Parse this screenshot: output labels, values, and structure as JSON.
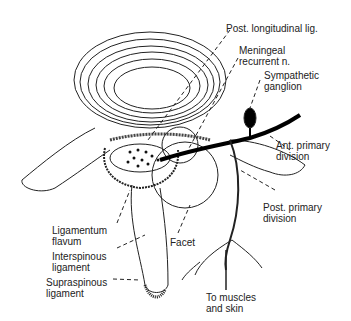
{
  "figure": {
    "labels": {
      "post_longitudinal_lig": "Post. longitudinal lig.",
      "meningeal_recurrent_n": "Meningeal\nrecurrent n.",
      "sympathetic_ganglion": "Sympathetic\nganglion",
      "ant_primary_division": "Ant. primary\ndivision",
      "post_primary_division": "Post. primary\ndivision",
      "ligamentum_flavum": "Ligamentum\nflavum",
      "interspinous_ligament": "Interspinous\nligament",
      "supraspinous_ligament": "Supraspinous\nligament",
      "facet": "Facet",
      "to_muscles_and_skin": "To muscles\nand skin"
    },
    "caption": "FIGURE — (cut off, illegible)"
  }
}
